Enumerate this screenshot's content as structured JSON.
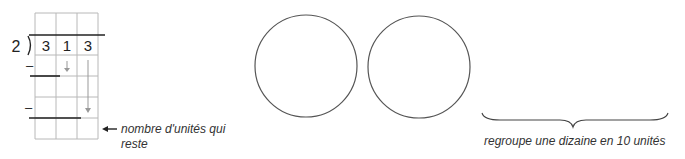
{
  "division": {
    "divisor": "2",
    "dividend_digits": [
      "3",
      "1",
      "3"
    ],
    "minus_signs": [
      "–",
      "–"
    ]
  },
  "annotations": {
    "remainder_label": "nombre d'unités qui reste",
    "brace_label": "regroupe une dizaine en 10 unités"
  },
  "circles": [
    {
      "cx": 306,
      "cy": 66,
      "r": 51
    },
    {
      "cx": 419,
      "cy": 67,
      "r": 51
    }
  ],
  "colors": {
    "grid": "#b8b8b8",
    "ink": "#222222",
    "arrow": "#999999"
  }
}
